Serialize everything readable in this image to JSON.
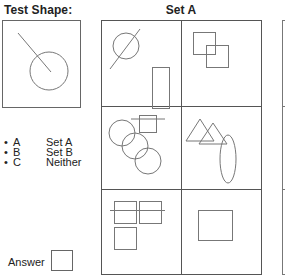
{
  "test_shape": {
    "title": "Test Shape:",
    "description": "circle with a line segment entering from top-left to the center"
  },
  "options": [
    {
      "bullet": "•",
      "letter": "A",
      "label": "Set A"
    },
    {
      "bullet": "•",
      "letter": "B",
      "label": "Set B"
    },
    {
      "bullet": "•",
      "letter": "C",
      "label": "Neither"
    }
  ],
  "answer": {
    "label": "Answer",
    "value": ""
  },
  "set_a": {
    "title": "Set A",
    "panels": [
      {
        "row": 1,
        "col": 1,
        "description": "circle crossed by diagonal line; tall rectangle"
      },
      {
        "row": 1,
        "col": 2,
        "description": "two overlapping squares"
      },
      {
        "row": 2,
        "col": 1,
        "description": "three overlapping circles in a diagonal chain; square with horizontal line through top"
      },
      {
        "row": 2,
        "col": 2,
        "description": "two overlapping triangles; vertical ellipse"
      },
      {
        "row": 3,
        "col": 1,
        "description": "three squares in L arrangement with horizontal line through top pair"
      },
      {
        "row": 3,
        "col": 2,
        "description": "single square"
      }
    ]
  },
  "colors": {
    "stroke": "#777777",
    "grid": "#555555",
    "text": "#222222"
  }
}
